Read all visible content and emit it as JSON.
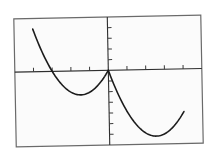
{
  "chart_data": {
    "type": "line",
    "title": "",
    "xlabel": "",
    "ylabel": "",
    "function": "f(x) = x^2 + 3x for x < 0; x^2 - 5x for x >= 0",
    "xlim": [
      -5,
      5
    ],
    "ylim": [
      -7,
      5
    ],
    "x_ticks": [
      -4,
      -3,
      -2,
      -1,
      1,
      2,
      3,
      4
    ],
    "y_ticks": [
      -6,
      -5,
      -4,
      -3,
      -2,
      -1,
      1,
      2,
      3,
      4
    ],
    "tick_labels_shown": false,
    "grid": false,
    "legend": null,
    "series": [
      {
        "name": "left branch",
        "x": [
          -4,
          -3.5,
          -3,
          -2.5,
          -2,
          -1.5,
          -1,
          -0.5,
          0
        ],
        "y": [
          4,
          1.75,
          0,
          -1.25,
          -2,
          -2.25,
          -2,
          -1.25,
          0
        ]
      },
      {
        "name": "right branch",
        "x": [
          0,
          0.5,
          1,
          1.5,
          2,
          2.5,
          3,
          3.5,
          4
        ],
        "y": [
          0,
          -2.25,
          -4,
          -5.25,
          -6,
          -6.25,
          -6,
          -5.25,
          -4
        ]
      }
    ],
    "key_points": {
      "cusp": [
        0,
        0
      ],
      "left_minimum": [
        -1.5,
        -2.25
      ],
      "right_minimum": [
        2.5,
        -6.25
      ],
      "x_intercepts": [
        -3,
        0
      ]
    }
  },
  "style": {
    "frame_color": "#6a6a6a",
    "axis_color": "#2e2e2e",
    "curve_color": "#1c1c1c",
    "background": "#ffffff"
  }
}
